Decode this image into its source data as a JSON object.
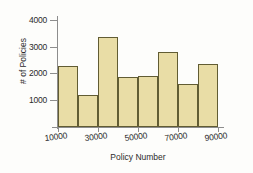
{
  "chart_data": {
    "type": "bar",
    "title": "",
    "subtitle": "",
    "xlabel": "Policy Number",
    "ylabel": "# of Policies",
    "grid": false,
    "legend": null,
    "legend_position": "none",
    "xlim": [
      10000,
      90000
    ],
    "ylim": [
      0,
      4000
    ],
    "bin_width": 10000,
    "xticks": [
      10000,
      30000,
      50000,
      70000,
      90000
    ],
    "xtick_labels": [
      "10000",
      "30000",
      "50000",
      "70000",
      "90000"
    ],
    "yticks": [
      1000,
      2000,
      3000,
      4000
    ],
    "ytick_labels": [
      "1000",
      "2000",
      "3000",
      "4000"
    ],
    "bin_edges": [
      10000,
      20000,
      30000,
      40000,
      50000,
      60000,
      70000,
      80000,
      90000
    ],
    "categories": [
      "10000-20000",
      "20000-30000",
      "30000-40000",
      "40000-50000",
      "50000-60000",
      "60000-70000",
      "70000-80000",
      "80000-90000"
    ],
    "values": [
      2270,
      1200,
      3370,
      1870,
      1900,
      2810,
      1610,
      2360
    ],
    "colors": {
      "bar_fill": "#e9dda6",
      "bar_border": "#615c33",
      "axis": "#8d8d8d",
      "text": "#2b2b2b",
      "background": "#fdfdfb"
    }
  }
}
